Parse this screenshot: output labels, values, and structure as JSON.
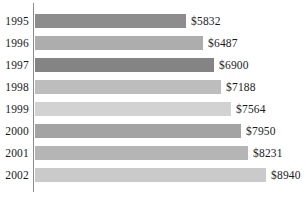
{
  "chart_data": {
    "type": "bar",
    "orientation": "horizontal",
    "title": "",
    "subtitle": "",
    "xlabel": "",
    "ylabel": "",
    "grid": false,
    "legend": "none",
    "xlim": [
      0,
      8940
    ],
    "categories": [
      "1995",
      "1996",
      "1997",
      "1998",
      "1999",
      "2000",
      "2001",
      "2002"
    ],
    "values": [
      5832,
      6487,
      6900,
      7188,
      7564,
      7950,
      8231,
      8940
    ],
    "value_labels": [
      "$5832",
      "$6487",
      "$6900",
      "$7188",
      "$7564",
      "$7950",
      "$8231",
      "$8940"
    ],
    "bar_colors": [
      "#8d8d8d",
      "#adadad",
      "#848484",
      "#bdbdbd",
      "#d2d2d2",
      "#a3a3a3",
      "#b5b5b5",
      "#cacaca"
    ],
    "axis_color": "#8c8c8c"
  },
  "bars": [
    {
      "year": "1995",
      "value_label": "$5832",
      "bar_width_px": 151,
      "color": "#8d8d8d"
    },
    {
      "year": "1996",
      "value_label": "$6487",
      "bar_width_px": 168,
      "color": "#adadad"
    },
    {
      "year": "1997",
      "value_label": "$6900",
      "bar_width_px": 179,
      "color": "#848484"
    },
    {
      "year": "1998",
      "value_label": "$7188",
      "bar_width_px": 186,
      "color": "#bdbdbd"
    },
    {
      "year": "1999",
      "value_label": "$7564",
      "bar_width_px": 196,
      "color": "#d2d2d2"
    },
    {
      "year": "2000",
      "value_label": "$7950",
      "bar_width_px": 206,
      "color": "#a3a3a3"
    },
    {
      "year": "2001",
      "value_label": "$8231",
      "bar_width_px": 213,
      "color": "#b5b5b5"
    },
    {
      "year": "2002",
      "value_label": "$8940",
      "bar_width_px": 231,
      "color": "#cacaca"
    }
  ]
}
